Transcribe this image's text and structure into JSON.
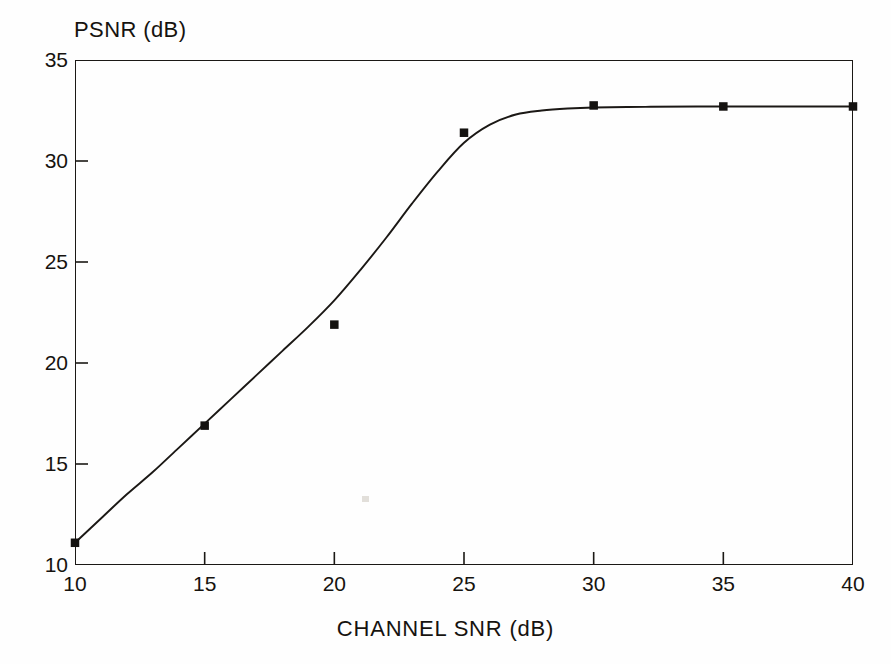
{
  "figure": {
    "background_color": "#fefefe",
    "ink_color": "#1b1815"
  },
  "axis_titles": {
    "y": "PSNR (dB)",
    "x": "CHANNEL SNR (dB)"
  },
  "chart_data": {
    "type": "scatter",
    "title": "",
    "subtitle": "",
    "xlabel": "CHANNEL SNR (dB)",
    "ylabel": "PSNR (dB)",
    "xlim": [
      10,
      40
    ],
    "ylim": [
      10,
      35
    ],
    "xticks": [
      10,
      15,
      20,
      25,
      30,
      35,
      40
    ],
    "yticks": [
      10,
      15,
      20,
      25,
      30,
      35
    ],
    "xtick_labels": [
      "10",
      "15",
      "20",
      "25",
      "30",
      "35",
      "40"
    ],
    "ytick_labels": [
      "10",
      "15",
      "20",
      "25",
      "30",
      "35"
    ],
    "grid": false,
    "legend": null,
    "legend_position": "none",
    "annotations": [],
    "marker_style": "filled-square",
    "marker_color": "#141210",
    "line_color": "#1b1815",
    "series": [
      {
        "name": "measured PSNR",
        "x": [
          10,
          15,
          20,
          25,
          30,
          35,
          40
        ],
        "values": [
          11.1,
          16.9,
          21.9,
          31.4,
          32.75,
          32.7,
          32.7
        ]
      },
      {
        "name": "fitted curve",
        "x": [
          10,
          11,
          12,
          13,
          14,
          15,
          16,
          17,
          18,
          19,
          20,
          21,
          22,
          23,
          24,
          25,
          26,
          27,
          28,
          29,
          30,
          32,
          34,
          36,
          38,
          40
        ],
        "values": [
          11.1,
          12.3,
          13.5,
          14.6,
          15.8,
          17.0,
          18.2,
          19.4,
          20.6,
          21.8,
          23.1,
          24.6,
          26.2,
          27.9,
          29.5,
          30.9,
          31.8,
          32.3,
          32.5,
          32.6,
          32.65,
          32.68,
          32.7,
          32.7,
          32.7,
          32.7
        ]
      }
    ]
  }
}
